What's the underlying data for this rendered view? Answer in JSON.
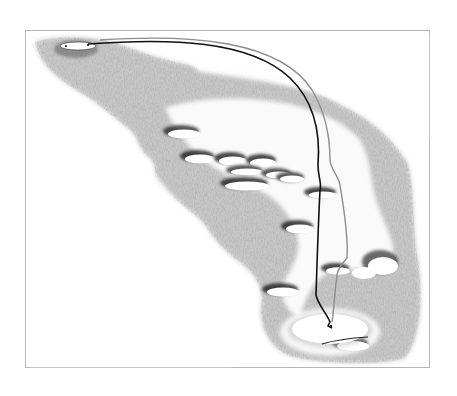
{
  "diagram": {
    "type": "golf-hole-layout",
    "frame": {
      "x": 25,
      "y": 30,
      "width": 404,
      "height": 337,
      "stroke": "#b5b5b5"
    },
    "colors": {
      "background": "#ffffff",
      "rough": "#8a8a8a",
      "rough_light": "#bdbdbd",
      "bunker_fill": "#ffffff",
      "bunker_shadow": "#1a1a1a",
      "path_primary": "#111111",
      "path_secondary": "#8c8c8c",
      "green_fill": "#ffffff"
    },
    "tee": {
      "cx": 78,
      "cy": 46,
      "rx": 18,
      "ry": 4
    },
    "green": {
      "cx": 330,
      "cy": 330,
      "rx": 40,
      "ry": 16
    },
    "paths": [
      {
        "name": "primary-shot-path",
        "color": "#111111"
      },
      {
        "name": "secondary-shot-path",
        "color": "#8c8c8c"
      }
    ],
    "bunkers": [
      {
        "cx": 183,
        "cy": 133,
        "rx": 16,
        "ry": 5
      },
      {
        "cx": 199,
        "cy": 158,
        "rx": 15,
        "ry": 5
      },
      {
        "cx": 232,
        "cy": 160,
        "rx": 14,
        "ry": 5
      },
      {
        "cx": 262,
        "cy": 162,
        "rx": 13,
        "ry": 5
      },
      {
        "cx": 246,
        "cy": 172,
        "rx": 16,
        "ry": 4
      },
      {
        "cx": 278,
        "cy": 175,
        "rx": 13,
        "ry": 4
      },
      {
        "cx": 291,
        "cy": 179,
        "rx": 12,
        "ry": 4
      },
      {
        "cx": 246,
        "cy": 185,
        "rx": 22,
        "ry": 5
      },
      {
        "cx": 322,
        "cy": 194,
        "rx": 14,
        "ry": 4
      },
      {
        "cx": 299,
        "cy": 229,
        "rx": 14,
        "ry": 5
      },
      {
        "cx": 337,
        "cy": 270,
        "rx": 12,
        "ry": 5
      },
      {
        "cx": 382,
        "cy": 265,
        "rx": 16,
        "ry": 11
      },
      {
        "cx": 282,
        "cy": 291,
        "rx": 16,
        "ry": 6
      },
      {
        "cx": 352,
        "cy": 346,
        "rx": 16,
        "ry": 5
      }
    ]
  }
}
